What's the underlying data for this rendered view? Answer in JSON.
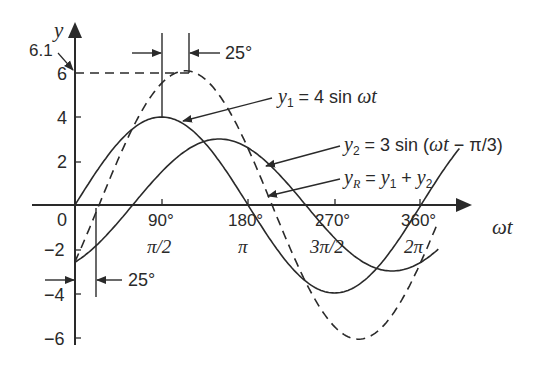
{
  "diagram": {
    "axes": {
      "y_label": "y",
      "x_label": "ωt",
      "y_ticks": [
        "6",
        "4",
        "2",
        "0",
        "−2",
        "−4",
        "−6"
      ],
      "x_ticks_deg": [
        "90°",
        "180°",
        "270°",
        "360°"
      ],
      "x_ticks_rad": [
        "π/2",
        "π",
        "3π/2",
        "2π"
      ]
    },
    "annotations": {
      "peak_value": "6.1",
      "phase_shift_top": "25°",
      "phase_shift_bottom": "25°"
    },
    "equations": {
      "y1": {
        "var": "y",
        "sub": "1",
        "rhs": " = 4 sin ",
        "arg": "ωt"
      },
      "y2": {
        "var": "y",
        "sub": "2",
        "rhs": " = 3 sin (",
        "arg": "ωt",
        "tail": " − π/3)"
      },
      "yR": {
        "var": "y",
        "sub": "R",
        "rhs": " = ",
        "a": "y",
        "a_sub": "1",
        "plus": " + ",
        "b": "y",
        "b_sub": "2"
      }
    },
    "curves": [
      {
        "name": "y1",
        "amplitude": 4,
        "phase_deg": 0,
        "style": "solid"
      },
      {
        "name": "y2",
        "amplitude": 3,
        "phase_deg": -60,
        "style": "solid"
      },
      {
        "name": "yR",
        "amplitude": 6.1,
        "phase_deg": -25,
        "style": "dashed"
      }
    ],
    "colors": {
      "line": "#2a2a2a",
      "background": "#ffffff"
    }
  }
}
